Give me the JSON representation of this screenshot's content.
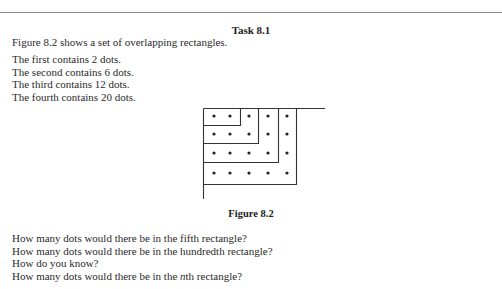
{
  "header": {
    "title": "Task 8.1"
  },
  "intro": "Figure 8.2 shows a set of overlapping rectangles.",
  "statements": [
    "The first contains 2 dots.",
    "The second contains 6 dots.",
    "The third contains 12 dots.",
    "The fourth contains 20 dots."
  ],
  "figure": {
    "caption": "Figure 8.2",
    "rectangles": [
      {
        "index": 1,
        "cols": 2,
        "rows": 1,
        "dots": 2
      },
      {
        "index": 2,
        "cols": 3,
        "rows": 2,
        "dots": 6
      },
      {
        "index": 3,
        "cols": 4,
        "rows": 3,
        "dots": 12
      },
      {
        "index": 4,
        "cols": 5,
        "rows": 4,
        "dots": 20
      }
    ]
  },
  "questions": [
    "How many dots would there be in the fifth rectangle?",
    "How many dots would there be in the hundredth rectangle?",
    "How do you know?",
    "How many dots would there be in the nth rectangle?"
  ]
}
